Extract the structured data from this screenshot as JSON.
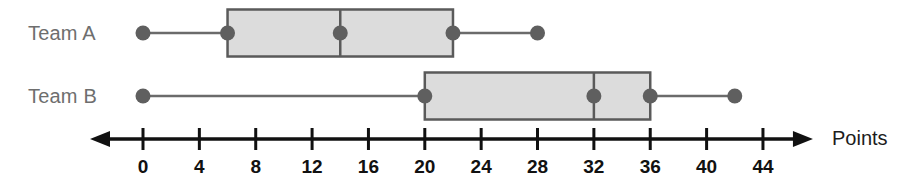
{
  "chart_data": {
    "type": "box",
    "title": "",
    "xlabel": "Points",
    "ylabel": "",
    "orientation": "horizontal",
    "xlim": [
      0,
      44
    ],
    "xtick_step": 4,
    "tick_labels": [
      "0",
      "4",
      "8",
      "12",
      "16",
      "20",
      "24",
      "28",
      "32",
      "36",
      "40",
      "44"
    ],
    "tick_values": [
      0,
      4,
      8,
      12,
      16,
      20,
      24,
      28,
      32,
      36,
      40,
      44
    ],
    "grid": false,
    "legend": "none",
    "axis_arrows": [
      "left",
      "right"
    ],
    "series": [
      {
        "name": "Team A",
        "min": 0,
        "q1": 6,
        "median": 14,
        "q3": 22,
        "max": 28
      },
      {
        "name": "Team B",
        "min": 0,
        "q1": 20,
        "median": 32,
        "q3": 36,
        "max": 42
      }
    ]
  },
  "colors": {
    "box_fill": "#dcdcdc",
    "box_stroke": "#5a5a5a",
    "whisker": "#6b6b6b",
    "marker": "#5f5f5f",
    "axis": "#111111",
    "label_text": "#6e6e6e",
    "tick_text": "#111111",
    "axis_title_text": "#1c1c1c"
  },
  "labels": {
    "team_a": "Team A",
    "team_b": "Team B",
    "points": "Points"
  },
  "ticks": {
    "t0": "0",
    "t1": "4",
    "t2": "8",
    "t3": "12",
    "t4": "16",
    "t5": "20",
    "t6": "24",
    "t7": "28",
    "t8": "32",
    "t9": "36",
    "t10": "40",
    "t11": "44"
  }
}
